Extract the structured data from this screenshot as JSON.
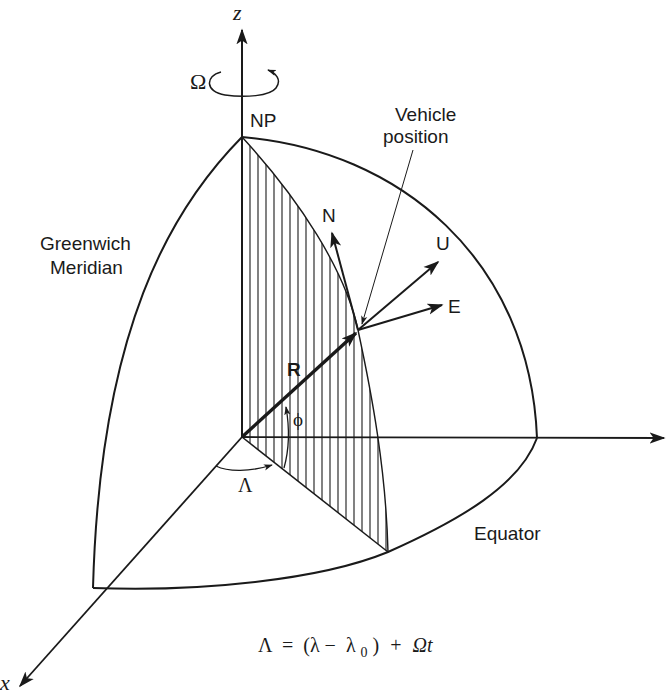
{
  "figure": {
    "type": "ECEF / ENU coordinate frame diagram on a rotating Earth octant",
    "colors": {
      "ink": "#1a1a1a",
      "background": "#ffffff"
    }
  },
  "axes": {
    "z_label": "z",
    "y_label": "y",
    "x_label": "x"
  },
  "rotation": {
    "symbol": "Ω"
  },
  "labels": {
    "north_pole": "NP",
    "vehicle_line1": "Vehicle",
    "vehicle_line2": "position",
    "greenwich_line1": "Greenwich",
    "greenwich_line2": "Meridian",
    "equator": "Equator",
    "radius_vector": "R",
    "latitude": "ϕ",
    "longitude": "Λ"
  },
  "local_frame": {
    "north": "N",
    "up": "U",
    "east": "E"
  },
  "equation": {
    "lhs": "Λ",
    "eq": "=",
    "open": "(λ −",
    "lambda0": "λ",
    "subscript": "0",
    "close": ")",
    "plus": "+",
    "omega_t": "Ωt"
  }
}
